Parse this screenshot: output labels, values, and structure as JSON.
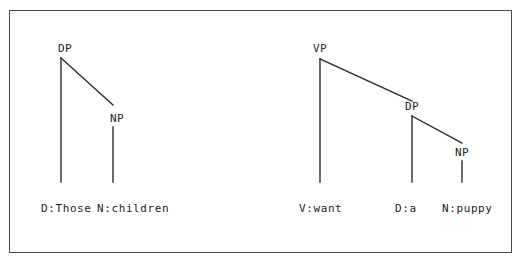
{
  "figure": {
    "background_color": "#ffffff",
    "frame": {
      "border_color": "#4a4a4a",
      "fill_color": "#ffffff"
    },
    "line_color": "#2b2b2b",
    "text_color": "#232323"
  },
  "trees": [
    {
      "id": "dp-tree",
      "name": "determiner-phrase-tree",
      "nodes": [
        {
          "id": "dp-root",
          "label": "DP",
          "x": 58,
          "y": 52,
          "apex_x": 61,
          "apex_y": 58
        },
        {
          "id": "dp-np",
          "label": "NP",
          "x": 110,
          "y": 122,
          "apex_x": 113,
          "apex_y": 127
        }
      ],
      "edges": [
        {
          "id": "dp-to-d",
          "x1": 61,
          "y1": 58,
          "x2": 61,
          "y2": 182
        },
        {
          "id": "dp-to-np",
          "x1": 61,
          "y1": 58,
          "x2": 113,
          "y2": 105
        },
        {
          "id": "np-to-n",
          "x1": 113,
          "y1": 127,
          "x2": 113,
          "y2": 182
        }
      ],
      "terminals": [
        {
          "id": "terminal-d-those",
          "label": "D:Those",
          "x": 41,
          "y": 212
        },
        {
          "id": "terminal-n-children",
          "label": "N:children",
          "x": 97,
          "y": 212
        }
      ]
    },
    {
      "id": "vp-tree",
      "name": "verb-phrase-tree",
      "nodes": [
        {
          "id": "vp-root",
          "label": "VP",
          "x": 313,
          "y": 52,
          "apex_x": 320,
          "apex_y": 59
        },
        {
          "id": "vp-dp",
          "label": "DP",
          "x": 405,
          "y": 110,
          "apex_x": 412,
          "apex_y": 116
        },
        {
          "id": "vp-np",
          "label": "NP",
          "x": 455,
          "y": 156,
          "apex_x": 462,
          "apex_y": 161
        }
      ],
      "edges": [
        {
          "id": "vp-to-v",
          "x1": 320,
          "y1": 59,
          "x2": 320,
          "y2": 182
        },
        {
          "id": "vp-to-dp",
          "x1": 320,
          "y1": 59,
          "x2": 412,
          "y2": 101
        },
        {
          "id": "dp-to-d2",
          "x1": 412,
          "y1": 116,
          "x2": 412,
          "y2": 182
        },
        {
          "id": "dp-to-np2",
          "x1": 412,
          "y1": 116,
          "x2": 462,
          "y2": 143
        },
        {
          "id": "np-to-n2",
          "x1": 462,
          "y1": 161,
          "x2": 462,
          "y2": 182
        }
      ],
      "terminals": [
        {
          "id": "terminal-v-want",
          "label": "V:want",
          "x": 299,
          "y": 212
        },
        {
          "id": "terminal-d-a",
          "label": "D:a",
          "x": 395,
          "y": 212
        },
        {
          "id": "terminal-n-puppy",
          "label": "N:puppy",
          "x": 442,
          "y": 212
        }
      ]
    }
  ]
}
